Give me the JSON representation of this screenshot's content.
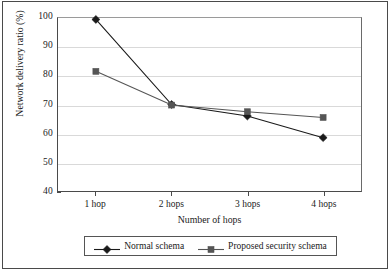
{
  "chart_data": {
    "type": "line",
    "title": "",
    "xlabel": "Number of hops",
    "ylabel": "Network delivery ratio (%)",
    "categories": [
      "1 hop",
      "2 hops",
      "3 hops",
      "4 hops"
    ],
    "ylim": [
      40,
      100
    ],
    "yticks": [
      40,
      50,
      60,
      70,
      80,
      90,
      100
    ],
    "ytick_labels": [
      "40",
      "50",
      "60",
      "70",
      "80",
      "90",
      "100"
    ],
    "grid": "horizontal",
    "legend_position": "bottom",
    "series": [
      {
        "name": "Normal schema",
        "marker": "diamond",
        "color": "#1a1a1a",
        "values": [
          99.5,
          70.0,
          66.0,
          58.5
        ]
      },
      {
        "name": "Proposed security schema",
        "marker": "square",
        "color": "#555555",
        "values": [
          81.5,
          69.8,
          67.5,
          65.5
        ]
      }
    ]
  },
  "colors": {
    "normal_schema": "#1a1a1a",
    "proposed_schema": "#555555",
    "gridline": "#d9d9d9",
    "axis": "#4a4a4a",
    "frame": "#4a4a4a",
    "background": "#ffffff"
  }
}
